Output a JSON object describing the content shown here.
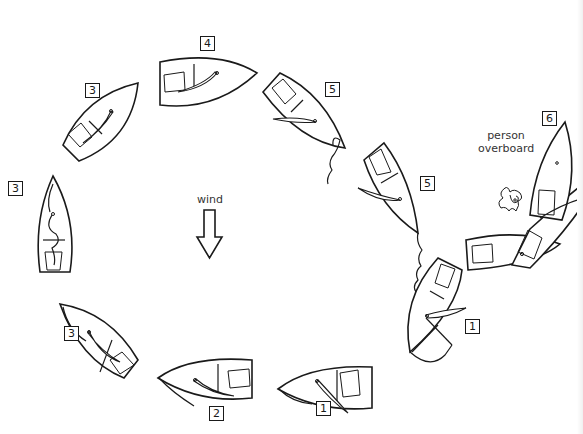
{
  "diagram": {
    "wind_label": "wind",
    "person_overboard_label": [
      "person",
      "overboard"
    ],
    "step_labels": [
      {
        "id": "label-1a",
        "text": "1",
        "x": 316,
        "y": 401
      },
      {
        "id": "label-1b",
        "text": "1",
        "x": 465,
        "y": 319
      },
      {
        "id": "label-2",
        "text": "2",
        "x": 209,
        "y": 406
      },
      {
        "id": "label-3a",
        "text": "3",
        "x": 64,
        "y": 326
      },
      {
        "id": "label-3b",
        "text": "3",
        "x": 8,
        "y": 181
      },
      {
        "id": "label-3c",
        "text": "3",
        "x": 85,
        "y": 83
      },
      {
        "id": "label-4",
        "text": "4",
        "x": 200,
        "y": 36
      },
      {
        "id": "label-5a",
        "text": "5",
        "x": 325,
        "y": 82
      },
      {
        "id": "label-5b",
        "text": "5",
        "x": 420,
        "y": 176
      },
      {
        "id": "label-6",
        "text": "6",
        "x": 542,
        "y": 111
      }
    ],
    "colors": {
      "ink": "#1a1a1a",
      "background": "#ffffff",
      "text": "#333333"
    }
  }
}
